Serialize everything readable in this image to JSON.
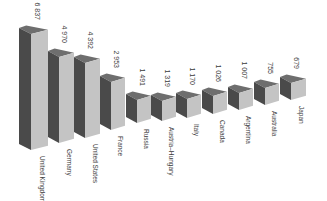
{
  "chart_data": {
    "type": "bar",
    "style": "3d-bars",
    "title": "",
    "xlabel": "",
    "ylabel": "",
    "grid": false,
    "legend": null,
    "categories": [
      "United Kingdom",
      "Germany",
      "United States",
      "France",
      "Russia",
      "Austria-Hungary",
      "Italy",
      "Canada",
      "Argentina",
      "Australia",
      "Japan"
    ],
    "values": [
      6837,
      4970,
      4392,
      2953,
      1491,
      1319,
      1170,
      1026,
      1007,
      755,
      679
    ],
    "value_labels": [
      "6 837",
      "4 970",
      "4 392",
      "2 953",
      "1 491",
      "1 319",
      "1 170",
      "1 026",
      "1 007",
      "755",
      "679"
    ],
    "colors": {
      "front": "#c4c4c4",
      "side": "#4a4a4a",
      "top": "#6e6e6e"
    }
  },
  "bars": [
    {
      "label": "United Kingdom",
      "value_label": "6 837",
      "x": 19,
      "w": 29,
      "top": 28,
      "bottom": 150
    },
    {
      "label": "Germany",
      "value_label": "4 970",
      "x": 48,
      "w": 26,
      "top": 51,
      "bottom": 143
    },
    {
      "label": "United States",
      "value_label": "4 392",
      "x": 74,
      "w": 26,
      "top": 57,
      "bottom": 138
    },
    {
      "label": "France",
      "value_label": "2 953",
      "x": 100,
      "w": 25,
      "top": 76,
      "bottom": 130
    },
    {
      "label": "Russia",
      "value_label": "1 491",
      "x": 126,
      "w": 25,
      "top": 94,
      "bottom": 123
    },
    {
      "label": "Austria–Hungary",
      "value_label": "1 319",
      "x": 151,
      "w": 25,
      "top": 95,
      "bottom": 121
    },
    {
      "label": "Italy",
      "value_label": "1 170",
      "x": 176,
      "w": 25,
      "top": 93,
      "bottom": 118
    },
    {
      "label": "Canada",
      "value_label": "1 026",
      "x": 202,
      "w": 25,
      "top": 90,
      "bottom": 114
    },
    {
      "label": "Argentina",
      "value_label": "1 007",
      "x": 228,
      "w": 25,
      "top": 87,
      "bottom": 110
    },
    {
      "label": "Australia",
      "value_label": "755",
      "x": 254,
      "w": 25,
      "top": 82,
      "bottom": 105
    },
    {
      "label": "Japan",
      "value_label": "679",
      "x": 280,
      "w": 26,
      "top": 77,
      "bottom": 100
    }
  ]
}
